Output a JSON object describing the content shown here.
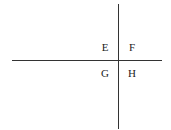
{
  "diagram": {
    "type": "quadrant-axes",
    "quadrants": [
      {
        "position": "top-left",
        "label": "E"
      },
      {
        "position": "top-right",
        "label": "F"
      },
      {
        "position": "bottom-left",
        "label": "G"
      },
      {
        "position": "bottom-right",
        "label": "H"
      }
    ],
    "line_color": "#333333"
  }
}
